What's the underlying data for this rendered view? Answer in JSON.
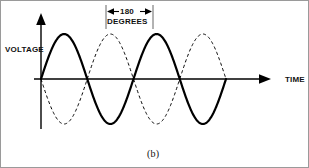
{
  "figure": {
    "caption": "(b)",
    "axis": {
      "y_label": "VOLTAGE",
      "x_label": "TIME",
      "y_arrow_icon": "up-arrow-icon",
      "x_arrow_icon": "right-arrow-icon"
    },
    "annotation": {
      "value": "180",
      "unit": "DEGREES",
      "left_arrow_icon": "dimension-arrow-left-icon",
      "right_arrow_icon": "dimension-arrow-right-icon"
    },
    "colors": {
      "ink": "#000000",
      "border": "#9a9a9a",
      "background": "#ffffff",
      "annotation_line": "#555555"
    }
  },
  "chart_data": {
    "type": "line",
    "title": "",
    "subtitle": "",
    "xlabel": "TIME",
    "ylabel": "VOLTAGE",
    "xlim": [
      0,
      360
    ],
    "ylim": [
      -1,
      1
    ],
    "grid": false,
    "legend": null,
    "axis_ticks": {
      "x": [],
      "y": []
    },
    "annotations": [
      {
        "text": "180 DEGREES",
        "type": "dimension",
        "x_start_deg": 140,
        "x_end_deg": 320,
        "span_deg": 180
      }
    ],
    "series": [
      {
        "name": "solid-wave",
        "style": "solid",
        "color": "#000000",
        "line_width": 2.2,
        "waveform": "sine",
        "amplitude": 1,
        "period_deg": 360,
        "phase_deg": 0,
        "x_start_deg": 0,
        "x_end_deg": 720,
        "cycles": 2,
        "x": [
          0,
          45,
          90,
          135,
          180,
          225,
          270,
          315,
          360,
          405,
          450,
          495,
          540,
          585,
          630,
          675,
          720
        ],
        "values": [
          0,
          0.707,
          1,
          0.707,
          0,
          -0.707,
          -1,
          -0.707,
          0,
          0.707,
          1,
          0.707,
          0,
          -0.707,
          -1,
          -0.707,
          0
        ]
      },
      {
        "name": "dashed-wave",
        "style": "dashed",
        "color": "#000000",
        "line_width": 1,
        "waveform": "sine",
        "amplitude": 1,
        "period_deg": 360,
        "phase_deg": 180,
        "x_start_deg": 0,
        "x_end_deg": 720,
        "cycles": 2,
        "x": [
          0,
          45,
          90,
          135,
          180,
          225,
          270,
          315,
          360,
          405,
          450,
          495,
          540,
          585,
          630,
          675,
          720
        ],
        "values": [
          0,
          -0.707,
          -1,
          -0.707,
          0,
          0.707,
          1,
          0.707,
          0,
          -0.707,
          -1,
          -0.707,
          0,
          0.707,
          1,
          0.707,
          0
        ]
      }
    ]
  }
}
